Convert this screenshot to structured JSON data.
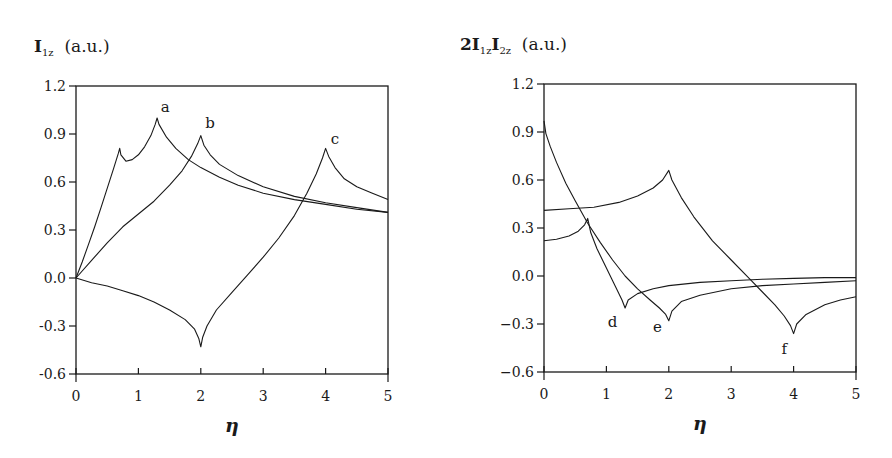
{
  "chart_data": [
    {
      "type": "line",
      "title": "I1z (a.u.)",
      "title_main": "I",
      "title_sub": "1z",
      "title_unit": "(a.u.)",
      "xlabel": "η",
      "ylabel": "",
      "xlim": [
        0,
        5
      ],
      "ylim": [
        -0.6,
        1.2
      ],
      "xticks": [
        0,
        1,
        2,
        3,
        4,
        5
      ],
      "yticks": [
        -0.6,
        -0.3,
        0.0,
        0.3,
        0.6,
        0.9,
        1.2
      ],
      "ytick_labels": [
        "-0.6",
        "-0.3",
        "0.0",
        "0.3",
        "0.6",
        "0.9",
        "1.2"
      ],
      "grid": false,
      "series": [
        {
          "name": "a",
          "label_pos": [
            1.43,
            1.04
          ],
          "x": [
            0,
            0.1,
            0.2,
            0.3,
            0.4,
            0.5,
            0.6,
            0.68,
            0.7,
            0.72,
            0.8,
            0.9,
            1.0,
            1.1,
            1.2,
            1.27,
            1.3,
            1.33,
            1.45,
            1.6,
            1.8,
            2.0,
            2.3,
            2.6,
            3.0,
            3.5,
            4.0,
            4.5,
            5.0
          ],
          "y": [
            0,
            0.1,
            0.21,
            0.32,
            0.44,
            0.56,
            0.68,
            0.78,
            0.81,
            0.77,
            0.73,
            0.74,
            0.77,
            0.82,
            0.89,
            0.96,
            1.0,
            0.96,
            0.88,
            0.81,
            0.74,
            0.69,
            0.63,
            0.58,
            0.53,
            0.49,
            0.46,
            0.43,
            0.41
          ]
        },
        {
          "name": "b",
          "label_pos": [
            2.15,
            0.94
          ],
          "x": [
            0,
            0.25,
            0.5,
            0.75,
            1.0,
            1.25,
            1.5,
            1.7,
            1.85,
            1.95,
            2.0,
            2.05,
            2.15,
            2.3,
            2.6,
            3.0,
            3.5,
            4.0,
            4.5,
            5.0
          ],
          "y": [
            0,
            0.11,
            0.22,
            0.32,
            0.4,
            0.48,
            0.58,
            0.67,
            0.76,
            0.84,
            0.89,
            0.83,
            0.77,
            0.71,
            0.64,
            0.57,
            0.51,
            0.47,
            0.44,
            0.41
          ]
        },
        {
          "name": "c",
          "label_pos": [
            4.15,
            0.84
          ],
          "x": [
            0,
            0.25,
            0.5,
            0.75,
            1.0,
            1.25,
            1.5,
            1.75,
            1.9,
            1.97,
            2.0,
            2.03,
            2.1,
            2.25,
            2.5,
            2.75,
            3.0,
            3.25,
            3.5,
            3.7,
            3.85,
            3.95,
            4.0,
            4.05,
            4.15,
            4.3,
            4.5,
            4.75,
            5.0
          ],
          "y": [
            0,
            -0.03,
            -0.05,
            -0.08,
            -0.11,
            -0.15,
            -0.2,
            -0.26,
            -0.32,
            -0.38,
            -0.43,
            -0.37,
            -0.3,
            -0.2,
            -0.09,
            0.02,
            0.13,
            0.25,
            0.39,
            0.53,
            0.65,
            0.75,
            0.81,
            0.76,
            0.69,
            0.62,
            0.57,
            0.53,
            0.49
          ]
        }
      ]
    },
    {
      "type": "line",
      "title": "2I1zI2z (a.u.)",
      "title_prefix": "2",
      "title_main": "I",
      "title_sub": "1z",
      "title_main2": "I",
      "title_sub2": "2z",
      "title_unit": "(a.u.)",
      "xlabel": "η",
      "ylabel": "",
      "xlim": [
        0,
        5
      ],
      "ylim": [
        -0.6,
        1.2
      ],
      "xticks": [
        0,
        1,
        2,
        3,
        4,
        5
      ],
      "yticks": [
        -0.6,
        -0.3,
        0.0,
        0.3,
        0.6,
        0.9,
        1.2
      ],
      "ytick_labels": [
        "−0.6",
        "−0.3",
        "0.0",
        "0.3",
        "0.6",
        "0.9",
        "1.2"
      ],
      "grid": false,
      "series": [
        {
          "name": "d",
          "label_pos": [
            1.1,
            -0.32
          ],
          "x": [
            0,
            0.2,
            0.4,
            0.55,
            0.65,
            0.7,
            0.75,
            0.85,
            1.0,
            1.15,
            1.25,
            1.3,
            1.35,
            1.5,
            1.75,
            2.0,
            2.5,
            3.0,
            3.5,
            4.0,
            4.5,
            5.0
          ],
          "y": [
            0.22,
            0.23,
            0.25,
            0.28,
            0.32,
            0.36,
            0.27,
            0.17,
            0.05,
            -0.07,
            -0.15,
            -0.2,
            -0.15,
            -0.11,
            -0.08,
            -0.06,
            -0.04,
            -0.03,
            -0.02,
            -0.015,
            -0.01,
            -0.01
          ]
        },
        {
          "name": "e",
          "label_pos": [
            1.82,
            -0.35
          ],
          "x": [
            0,
            0.03,
            0.1,
            0.2,
            0.35,
            0.5,
            0.7,
            0.9,
            1.1,
            1.3,
            1.5,
            1.7,
            1.85,
            1.95,
            2.0,
            2.05,
            2.2,
            2.5,
            3.0,
            3.5,
            4.0,
            4.5,
            5.0
          ],
          "y": [
            0.97,
            0.89,
            0.81,
            0.71,
            0.58,
            0.47,
            0.33,
            0.21,
            0.1,
            0.0,
            -0.08,
            -0.15,
            -0.2,
            -0.24,
            -0.28,
            -0.22,
            -0.16,
            -0.12,
            -0.08,
            -0.06,
            -0.05,
            -0.04,
            -0.03
          ]
        },
        {
          "name": "f",
          "label_pos": [
            3.85,
            -0.49
          ],
          "x": [
            0,
            0.4,
            0.8,
            1.2,
            1.5,
            1.75,
            1.9,
            2.0,
            2.05,
            2.2,
            2.4,
            2.7,
            3.0,
            3.3,
            3.5,
            3.7,
            3.85,
            3.95,
            4.0,
            4.05,
            4.2,
            4.5,
            4.75,
            5.0
          ],
          "y": [
            0.41,
            0.42,
            0.43,
            0.46,
            0.5,
            0.55,
            0.6,
            0.66,
            0.6,
            0.49,
            0.37,
            0.22,
            0.1,
            -0.02,
            -0.1,
            -0.18,
            -0.25,
            -0.31,
            -0.36,
            -0.3,
            -0.24,
            -0.18,
            -0.15,
            -0.13
          ]
        }
      ]
    }
  ],
  "panels": [
    {
      "title": {
        "main": "I",
        "sub": "1z",
        "unit": "(a.u.)"
      },
      "xlabel": "η"
    },
    {
      "title": {
        "prefix": "2",
        "main": "I",
        "sub": "1z",
        "main2": "I",
        "sub2": "2z",
        "unit": "(a.u.)"
      },
      "xlabel": "η"
    }
  ]
}
